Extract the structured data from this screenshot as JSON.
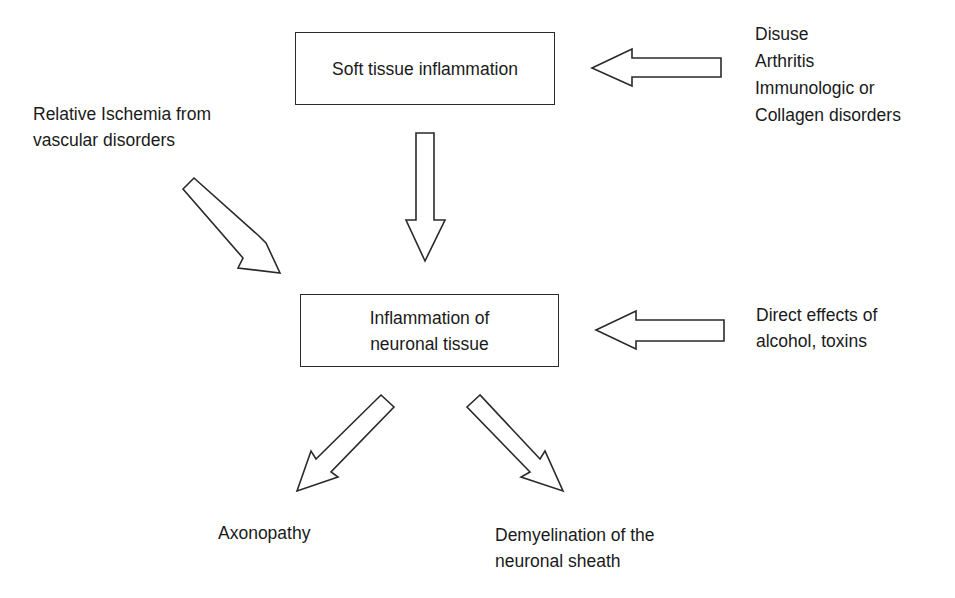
{
  "diagram": {
    "boxes": {
      "soft_tissue": {
        "label": "Soft tissue inflammation"
      },
      "neuronal": {
        "lines": [
          "Inflammation of",
          "neuronal tissue"
        ]
      }
    },
    "inputs": {
      "systemic_causes": {
        "lines": [
          "Disuse",
          "Arthritis",
          "Immunologic or",
          "Collagen disorders"
        ]
      },
      "ischemia": {
        "lines": [
          "Relative Ischemia from",
          "vascular disorders"
        ]
      },
      "direct_effects": {
        "lines": [
          "Direct effects of",
          "alcohol, toxins"
        ]
      }
    },
    "outcomes": {
      "axonopathy": {
        "lines": [
          "Axonopathy"
        ]
      },
      "demyelination": {
        "lines": [
          "Demyelination of the",
          "neuronal sheath"
        ]
      }
    },
    "arrows": [
      {
        "from": "systemic_causes",
        "to": "soft_tissue",
        "direction": "left"
      },
      {
        "from": "soft_tissue",
        "to": "neuronal",
        "direction": "down"
      },
      {
        "from": "ischemia",
        "to": "neuronal",
        "direction": "down-right"
      },
      {
        "from": "direct_effects",
        "to": "neuronal",
        "direction": "left"
      },
      {
        "from": "neuronal",
        "to": "axonopathy",
        "direction": "down-left"
      },
      {
        "from": "neuronal",
        "to": "demyelination",
        "direction": "down-right"
      }
    ]
  },
  "colors": {
    "background": "#ffffff",
    "stroke": "#2a2a2a",
    "text": "#1a1a1a"
  }
}
